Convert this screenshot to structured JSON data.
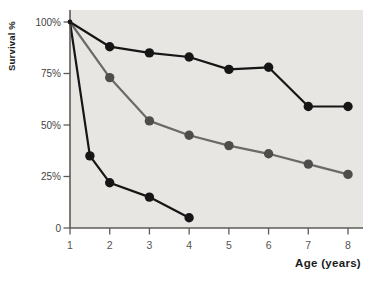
{
  "figure": {
    "background": "#ffffff"
  },
  "chart_data": {
    "type": "line",
    "title": "",
    "xlabel": "Age (years)",
    "ylabel": "Survival %",
    "xlim": [
      1,
      8.4
    ],
    "ylim": [
      0,
      106
    ],
    "grid": false,
    "legend": "none",
    "plot_bg": "#e8e6e2",
    "axis_color": "#5e5b56",
    "x_ticks": [
      {
        "v": 1,
        "label": "1"
      },
      {
        "v": 2,
        "label": "2"
      },
      {
        "v": 3,
        "label": "3"
      },
      {
        "v": 4,
        "label": "4"
      },
      {
        "v": 5,
        "label": "5"
      },
      {
        "v": 6,
        "label": "6"
      },
      {
        "v": 7,
        "label": "7"
      },
      {
        "v": 8,
        "label": "8"
      }
    ],
    "y_ticks": [
      {
        "v": 100,
        "label": "100%"
      },
      {
        "v": 75,
        "label": "75%"
      },
      {
        "v": 50,
        "label": "50%"
      },
      {
        "v": 25,
        "label": "25%"
      },
      {
        "v": 0,
        "label": "0"
      }
    ],
    "series": [
      {
        "name": "survival-curve-middle",
        "color": "#6b6a68",
        "marker_color": "#4e4d4b",
        "points": [
          [
            1,
            100
          ],
          [
            2,
            73
          ],
          [
            3,
            52
          ],
          [
            4,
            45
          ],
          [
            5,
            40
          ],
          [
            6,
            36
          ],
          [
            7,
            31
          ],
          [
            8,
            26
          ]
        ]
      },
      {
        "name": "survival-curve-high",
        "color": "#161616",
        "marker_color": "#161616",
        "points": [
          [
            1,
            100
          ],
          [
            2,
            88
          ],
          [
            3,
            85
          ],
          [
            4,
            83
          ],
          [
            5,
            77
          ],
          [
            6,
            78
          ],
          [
            7,
            59
          ],
          [
            8,
            59
          ]
        ]
      },
      {
        "name": "survival-curve-low",
        "color": "#161616",
        "marker_color": "#161616",
        "points": [
          [
            1,
            100
          ],
          [
            1.5,
            35
          ],
          [
            2,
            22
          ],
          [
            3,
            15
          ],
          [
            4,
            5
          ]
        ]
      }
    ]
  }
}
